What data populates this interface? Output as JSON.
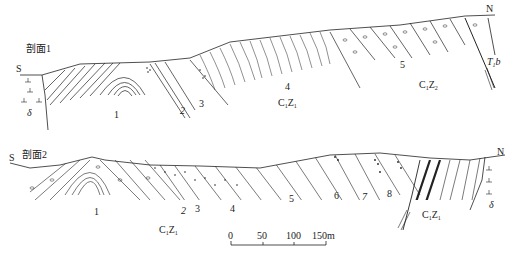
{
  "sections": [
    {
      "title": "剖面1",
      "left_dir": "S",
      "right_dir": "N",
      "layer_labels": [
        "1",
        "2",
        "3",
        "4",
        "5"
      ],
      "formations": [
        {
          "main": "C",
          "s1": "1",
          "z": "Z",
          "s2": "1"
        },
        {
          "main": "C",
          "s1": "1",
          "z": "Z",
          "s2": "2"
        }
      ],
      "intrusion_symbol": "δ",
      "right_unit": {
        "main": "T",
        "s1": "1",
        "z": "b"
      }
    },
    {
      "title": "剖面2",
      "left_dir": "S",
      "right_dir": "N",
      "layer_labels": [
        "1",
        "2",
        "3",
        "4",
        "5",
        "6",
        "7",
        "8"
      ],
      "formations": [
        {
          "main": "C",
          "s1": "1",
          "z": "Z",
          "s2": "1"
        },
        {
          "main": "C",
          "s1": "1",
          "z": "Z",
          "s2": "1"
        }
      ],
      "intrusion_symbol": "δ"
    }
  ],
  "scale_bar": {
    "ticks": [
      "0",
      "50",
      "100",
      "150m"
    ]
  },
  "colors": {
    "line": "#222222",
    "background": "#ffffff"
  }
}
